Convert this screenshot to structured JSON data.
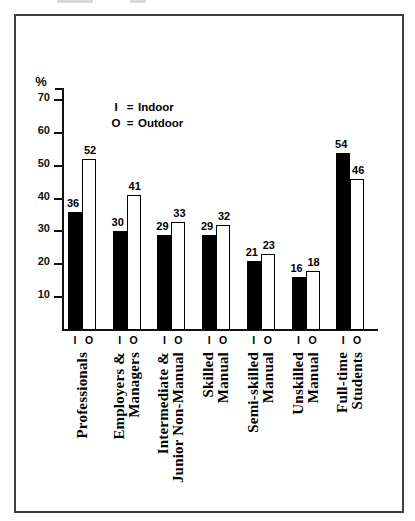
{
  "chart_data": {
    "type": "bar",
    "title": "",
    "ylabel": "%",
    "ylim": [
      0,
      75
    ],
    "yticks": [
      10,
      20,
      30,
      40,
      50,
      60,
      70
    ],
    "grid": false,
    "legend_position": "inside-top-left",
    "categories": [
      "Professionals",
      "Employers & Managers",
      "Intermediate & Junior Non-Manual",
      "Skilled Manual",
      "Semi-skilled Manual",
      "Unskilled Manual",
      "Full-time Students"
    ],
    "category_display": [
      "Professionals",
      "Employers &\nManagers",
      "Intermediate &\nJunior Non-Manual",
      "Skilled\nManual",
      "Semi-skilled\nManual",
      "Unskilled\nManual",
      "Full-time\nStudents"
    ],
    "series": [
      {
        "name": "Indoor",
        "symbol": "I",
        "color": "#000000",
        "values": [
          36,
          30,
          29,
          29,
          21,
          16,
          54
        ]
      },
      {
        "name": "Outdoor",
        "symbol": "O",
        "color": "#ffffff",
        "values": [
          52,
          41,
          33,
          32,
          23,
          18,
          46
        ]
      }
    ],
    "legend": [
      {
        "symbol": "I",
        "eq": "=",
        "label": "Indoor"
      },
      {
        "symbol": "O",
        "eq": "=",
        "label": "Outdoor"
      }
    ]
  }
}
